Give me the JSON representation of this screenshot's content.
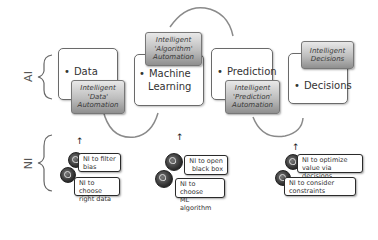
{
  "rows": {
    "ai_label": "AI",
    "ni_label": "NI"
  },
  "stages": [
    {
      "label": "Data",
      "tag": [
        "Intelligent",
        "'Data'",
        "Automation"
      ]
    },
    {
      "label_lines": [
        "Machine",
        "Learning"
      ],
      "tag": [
        "Intelligent",
        "'Algorithm'",
        "Automation"
      ]
    },
    {
      "label": "Prediction",
      "tag": [
        "Intelligent",
        "'Prediction'",
        "Automation"
      ]
    },
    {
      "label": "Decisions",
      "tag": [
        "Intelligent",
        "Decisions"
      ]
    }
  ],
  "ni_groups": [
    {
      "items": [
        [
          "NI to filter",
          "bias"
        ],
        [
          "NI to choose",
          "right data"
        ]
      ]
    },
    {
      "items": [
        [
          "NI to open",
          "black box"
        ],
        [
          "NI to choose",
          "ML algorithm"
        ]
      ]
    },
    {
      "items": [
        [
          "NI to optimize",
          "value via decisions"
        ],
        [
          "NI to consider",
          "constraints"
        ]
      ]
    }
  ],
  "icons": {
    "up_arrow": "↑"
  },
  "colors": {
    "box_border": "#6a6a6a",
    "tag_gradient_top": "#e8e8e8",
    "tag_gradient_bottom": "#8f8f8f",
    "arc": "#8a8a8a"
  }
}
